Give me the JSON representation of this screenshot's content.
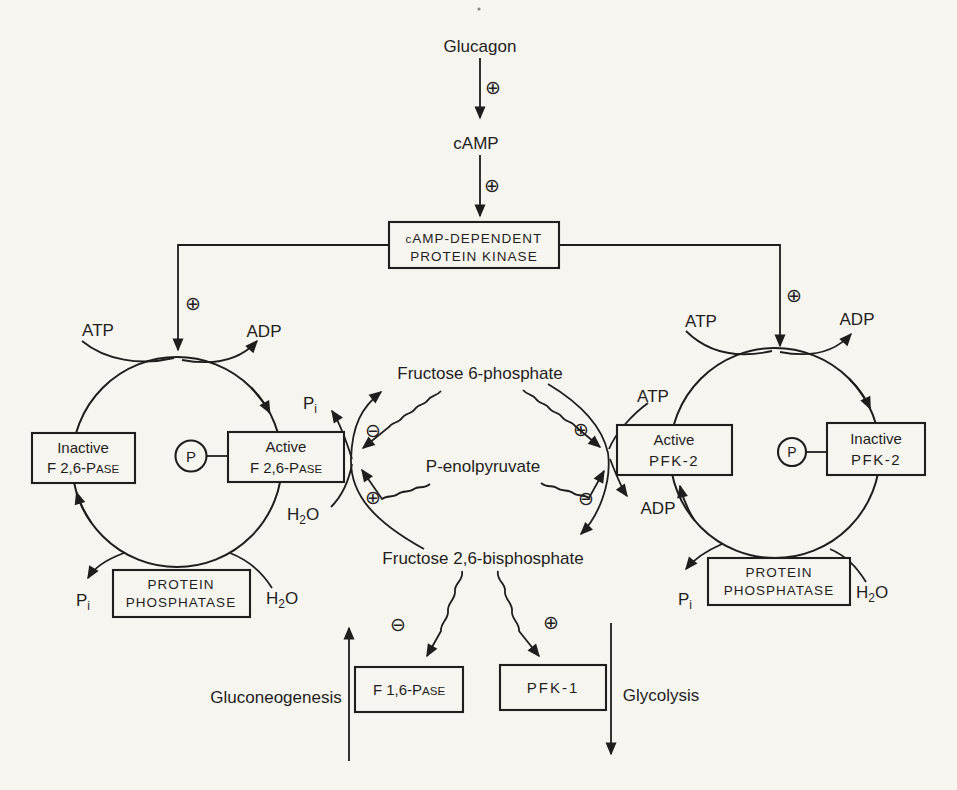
{
  "colors": {
    "paper": "#f6f5f0",
    "ink": "#1f1e1c"
  },
  "signs": {
    "plus": "⊕",
    "minus": "⊖"
  },
  "phospho": {
    "label": "P"
  },
  "molecules": {
    "glucagon": "Glucagon",
    "camp": "cAMP",
    "f6p": "Fructose 6-phosphate",
    "pep": "P-enolpyruvate",
    "f26bp": "Fructose 2,6-bisphosphate"
  },
  "cofactors": {
    "atp": "ATP",
    "adp": "ADP",
    "pi": {
      "main": "P",
      "sub": "i"
    },
    "h2o": {
      "h": "H",
      "two": "2",
      "o": "O"
    }
  },
  "enzymes": {
    "kinase": {
      "line1_small": "c",
      "line1_rest": "AMP-DEPENDENT",
      "line2": "PROTEIN KINASE"
    },
    "inactive_f26pase": {
      "line1": "Inactive",
      "line2_main": "F 2,6-P",
      "line2_small": "ASE"
    },
    "active_f26pase": {
      "line1": "Active",
      "line2_main": "F 2,6-P",
      "line2_small": "ASE"
    },
    "active_pfk2": {
      "line1": "Active",
      "line2": "PFK-2"
    },
    "inactive_pfk2": {
      "line1": "Inactive",
      "line2": "PFK-2"
    },
    "phosphatase": {
      "line1": "PROTEIN",
      "line2": "PHOSPHATASE"
    },
    "f16pase": {
      "main": "F 1,6-P",
      "small": "ASE"
    },
    "pfk1": "PFK-1"
  },
  "pathways": {
    "gluconeogenesis": "Gluconeogenesis",
    "glycolysis": "Glycolysis"
  }
}
